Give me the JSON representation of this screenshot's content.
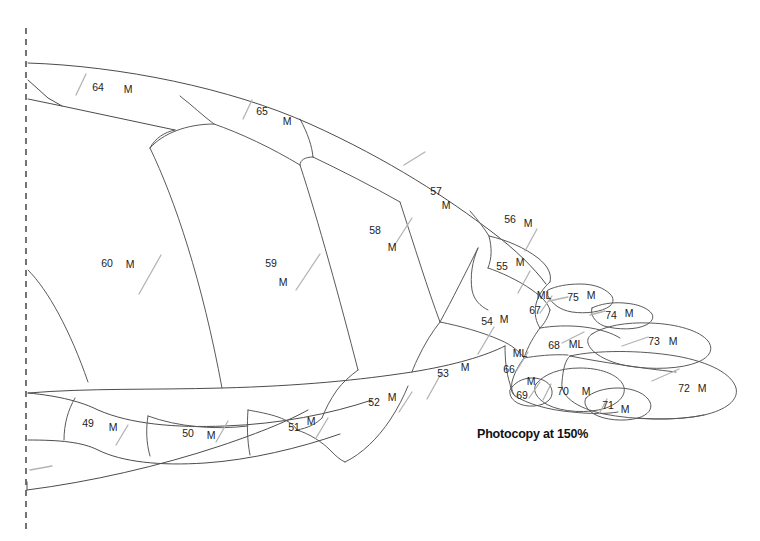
{
  "figure": {
    "note": "Photocopy at 150%",
    "note_position": {
      "x": 477,
      "y": 427
    },
    "axis": {
      "name": "midline-axis",
      "style": "dashed",
      "x": 26,
      "y_top": 28,
      "y_bottom": 532
    },
    "colors": {
      "outline": "#4c4c4c",
      "inner_line": "#5a5a5a",
      "tick": "#b3b3b3",
      "axis": "#3a3a3a",
      "text": "#1c1c1c",
      "background": "#ffffff"
    },
    "segments": [
      {
        "id": "64",
        "number": "64",
        "code": "M",
        "num_x": 98,
        "num_y": 88,
        "code_x": 128,
        "code_y": 90,
        "tick": {
          "x1": 86,
          "y1": 74,
          "x2": 76,
          "y2": 95
        }
      },
      {
        "id": "65",
        "number": "65",
        "code": "M",
        "num_x": 262,
        "num_y": 112,
        "code_x": 287,
        "code_y": 122,
        "tick": {
          "x1": 252,
          "y1": 100,
          "x2": 243,
          "y2": 119
        }
      },
      {
        "id": "60",
        "number": "60",
        "code": "M",
        "num_x": 107,
        "num_y": 264,
        "code_x": 130,
        "code_y": 265,
        "tick": {
          "x1": 161,
          "y1": 255,
          "x2": 139,
          "y2": 294
        }
      },
      {
        "id": "59",
        "number": "59",
        "code": "M",
        "num_x": 271,
        "num_y": 264,
        "code_x": 283,
        "code_y": 283,
        "tick": {
          "x1": 320,
          "y1": 254,
          "x2": 296,
          "y2": 290
        }
      },
      {
        "id": "58",
        "number": "58",
        "code": "M",
        "num_x": 375,
        "num_y": 231,
        "code_x": 392,
        "code_y": 248,
        "tick": {
          "x1": 412,
          "y1": 218,
          "x2": 394,
          "y2": 246
        }
      },
      {
        "id": "57",
        "number": "57",
        "code": "M",
        "num_x": 436,
        "num_y": 192,
        "code_x": 446,
        "code_y": 206,
        "tick": {
          "x1": 425,
          "y1": 152,
          "x2": 404,
          "y2": 165
        }
      },
      {
        "id": "56",
        "number": "56",
        "code": "M",
        "num_x": 510,
        "num_y": 220,
        "code_x": 528,
        "code_y": 224,
        "tick": {
          "x1": 537,
          "y1": 229,
          "x2": 525,
          "y2": 251
        }
      },
      {
        "id": "55",
        "number": "55",
        "code": "M",
        "num_x": 502,
        "num_y": 267,
        "code_x": 520,
        "code_y": 263,
        "tick": {
          "x1": 530,
          "y1": 271,
          "x2": 518,
          "y2": 293
        }
      },
      {
        "id": "54",
        "number": "54",
        "code": "M",
        "num_x": 487,
        "num_y": 322,
        "code_x": 504,
        "code_y": 320,
        "tick": {
          "x1": 494,
          "y1": 327,
          "x2": 478,
          "y2": 354
        }
      },
      {
        "id": "53",
        "number": "53",
        "code": "M",
        "num_x": 443,
        "num_y": 374,
        "code_x": 465,
        "code_y": 368,
        "tick": {
          "x1": 442,
          "y1": 372,
          "x2": 427,
          "y2": 399
        }
      },
      {
        "id": "52",
        "number": "52",
        "code": "M",
        "num_x": 374,
        "num_y": 403,
        "code_x": 392,
        "code_y": 398,
        "tick": {
          "x1": 412,
          "y1": 392,
          "x2": 399,
          "y2": 412
        }
      },
      {
        "id": "51",
        "number": "51",
        "code": "M",
        "num_x": 294,
        "num_y": 428,
        "code_x": 311,
        "code_y": 422,
        "tick": {
          "x1": 328,
          "y1": 418,
          "x2": 316,
          "y2": 438
        }
      },
      {
        "id": "50",
        "number": "50",
        "code": "M",
        "num_x": 188,
        "num_y": 434,
        "code_x": 211,
        "code_y": 436,
        "tick": {
          "x1": 228,
          "y1": 421,
          "x2": 216,
          "y2": 442
        }
      },
      {
        "id": "49",
        "number": "49",
        "code": "M",
        "num_x": 88,
        "num_y": 424,
        "code_x": 113,
        "code_y": 428,
        "tick": {
          "x1": 128,
          "y1": 425,
          "x2": 116,
          "y2": 445
        }
      },
      {
        "id": "67",
        "number": "67",
        "code": "ML",
        "num_x": 535,
        "num_y": 311,
        "code_x": 544,
        "code_y": 296,
        "tick": {
          "x1": 552,
          "y1": 296,
          "x2": 540,
          "y2": 313
        }
      },
      {
        "id": "66",
        "number": "66",
        "code": "ML",
        "num_x": 509,
        "num_y": 370,
        "code_x": 520,
        "code_y": 354,
        "tick": {
          "x1": 528,
          "y1": 352,
          "x2": 517,
          "y2": 370
        }
      },
      {
        "id": "68",
        "number": "68",
        "code": "ML",
        "num_x": 554,
        "num_y": 346,
        "code_x": 576,
        "code_y": 345,
        "tick": {
          "x1": 584,
          "y1": 332,
          "x2": 562,
          "y2": 343
        }
      },
      {
        "id": "69",
        "number": "69",
        "code": "M",
        "num_x": 522,
        "num_y": 396,
        "code_x": 531,
        "code_y": 382,
        "tick": {
          "x1": 540,
          "y1": 382,
          "x2": 529,
          "y2": 398
        }
      },
      {
        "id": "70",
        "number": "70",
        "code": "M",
        "num_x": 563,
        "num_y": 392,
        "code_x": 586,
        "code_y": 392,
        "tick": {
          "x1": 551,
          "y1": 384,
          "x2": 543,
          "y2": 400
        }
      },
      {
        "id": "71",
        "number": "71",
        "code": "M",
        "num_x": 608,
        "num_y": 406,
        "code_x": 625,
        "code_y": 410,
        "tick": {
          "x1": 607,
          "y1": 399,
          "x2": 599,
          "y2": 414
        }
      },
      {
        "id": "72",
        "number": "72",
        "code": "M",
        "num_x": 684,
        "num_y": 389,
        "code_x": 702,
        "code_y": 389,
        "tick": {
          "x1": 679,
          "y1": 369,
          "x2": 652,
          "y2": 381
        }
      },
      {
        "id": "73",
        "number": "73",
        "code": "M",
        "num_x": 654,
        "num_y": 342,
        "code_x": 673,
        "code_y": 342,
        "tick": {
          "x1": 648,
          "y1": 337,
          "x2": 622,
          "y2": 346
        }
      },
      {
        "id": "74",
        "number": "74",
        "code": "M",
        "num_x": 611,
        "num_y": 316,
        "code_x": 629,
        "code_y": 314,
        "tick": {
          "x1": 605,
          "y1": 311,
          "x2": 590,
          "y2": 315
        }
      },
      {
        "id": "75",
        "number": "75",
        "code": "M",
        "num_x": 573,
        "num_y": 298,
        "code_x": 591,
        "code_y": 296,
        "tick": {
          "x1": 568,
          "y1": 297,
          "x2": 549,
          "y2": 301
        }
      }
    ],
    "extra_ticks": [
      {
        "name": "tick-lower-left",
        "x1": 52,
        "y1": 466,
        "x2": 30,
        "y2": 470
      }
    ]
  }
}
